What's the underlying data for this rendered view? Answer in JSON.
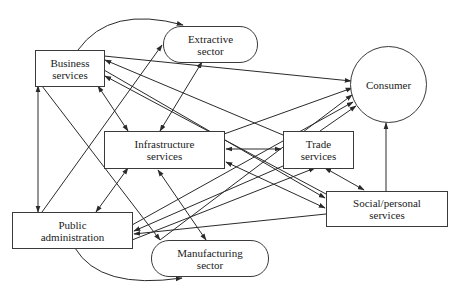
{
  "nodes": {
    "business": {
      "label": "Business\nservices"
    },
    "extractive": {
      "label": "Extractive\nsector"
    },
    "consumer": {
      "label": "Consumer"
    },
    "infrastructure": {
      "label": "Infrastructure\nservices"
    },
    "trade": {
      "label": "Trade\nservices"
    },
    "social": {
      "label": "Social/personal\nservices"
    },
    "public": {
      "label": "Public\nadministration"
    },
    "manufacturing": {
      "label": "Manufacturing\nsector"
    }
  },
  "colors": {
    "line": "#2a2a2a",
    "border": "#3a3a3a",
    "background": "#ffffff"
  }
}
